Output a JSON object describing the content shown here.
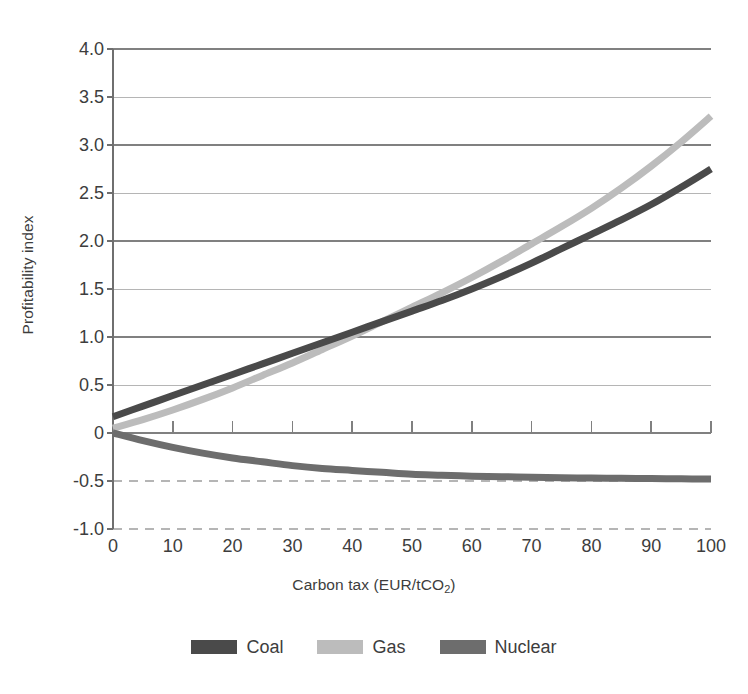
{
  "chart_data": {
    "type": "line",
    "title": "",
    "xlabel": "Carbon tax (EUR/tCO2)",
    "xlabel_main": "Carbon tax (EUR/tCO",
    "xlabel_sub": "2",
    "xlabel_tail": ")",
    "ylabel": "Profitability index",
    "xlim": [
      0,
      100
    ],
    "ylim": [
      -1.0,
      4.0
    ],
    "x_ticks": [
      0,
      10,
      20,
      30,
      40,
      50,
      60,
      70,
      80,
      90,
      100
    ],
    "x_tick_labels": [
      "0",
      "10",
      "20",
      "30",
      "40",
      "50",
      "60",
      "70",
      "80",
      "90",
      "100"
    ],
    "y_ticks": [
      4.0,
      3.5,
      3.0,
      2.5,
      2.0,
      1.5,
      1.0,
      0.5,
      0,
      -0.5,
      -1.0
    ],
    "y_tick_labels": [
      "4.0",
      "3.5",
      "3.0",
      "2.5",
      "2.0",
      "1.5",
      "1.0",
      "0.5",
      "0",
      "-0.5",
      "-1.0"
    ],
    "grid": true,
    "grid_note": "solid gridlines at integer values and half values above zero; dashed gridlines at -0.5 and -1.0",
    "legend_position": "bottom-center",
    "x": [
      0,
      5,
      10,
      15,
      20,
      25,
      30,
      35,
      40,
      45,
      50,
      55,
      60,
      65,
      70,
      75,
      80,
      85,
      90,
      95,
      100
    ],
    "series": [
      {
        "name": "Coal",
        "color": "#4a4a4a",
        "values": [
          0.17,
          0.28,
          0.39,
          0.5,
          0.61,
          0.72,
          0.83,
          0.94,
          1.05,
          1.16,
          1.27,
          1.38,
          1.5,
          1.63,
          1.77,
          1.92,
          2.07,
          2.22,
          2.38,
          2.56,
          2.75
        ]
      },
      {
        "name": "Gas",
        "color": "#bcbcbc",
        "values": [
          0.05,
          0.14,
          0.24,
          0.35,
          0.47,
          0.6,
          0.73,
          0.87,
          1.01,
          1.16,
          1.31,
          1.46,
          1.62,
          1.79,
          1.97,
          2.15,
          2.34,
          2.55,
          2.78,
          3.03,
          3.3
        ]
      },
      {
        "name": "Nuclear",
        "color": "#6d6d6d",
        "values": [
          0.0,
          -0.08,
          -0.15,
          -0.21,
          -0.26,
          -0.3,
          -0.34,
          -0.37,
          -0.39,
          -0.41,
          -0.43,
          -0.44,
          -0.45,
          -0.455,
          -0.46,
          -0.465,
          -0.47,
          -0.472,
          -0.475,
          -0.477,
          -0.48
        ]
      }
    ]
  },
  "legend": {
    "items": [
      {
        "label": "Coal",
        "color": "#4a4a4a"
      },
      {
        "label": "Gas",
        "color": "#bcbcbc"
      },
      {
        "label": "Nuclear",
        "color": "#6d6d6d"
      }
    ]
  },
  "colors": {
    "coal": "#4a4a4a",
    "gas": "#bcbcbc",
    "nuclear": "#6d6d6d",
    "grid_major": "#808080",
    "grid_minor": "#b5b5b5",
    "axis": "#6f6f6f",
    "text": "#3d3d3d",
    "background": "#ffffff"
  }
}
